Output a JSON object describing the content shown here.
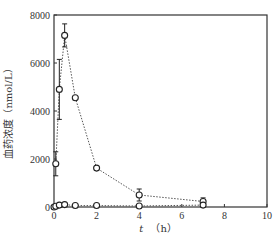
{
  "chart_data": {
    "type": "line",
    "title": "",
    "xlabel": "t （h）",
    "xlabel_var": "t",
    "xlabel_unit": "（h）",
    "ylabel": "血药浓度（nmol/L）",
    "xlim": [
      0,
      10
    ],
    "ylim": [
      0,
      8000
    ],
    "xticks": [
      0,
      2,
      4,
      6,
      8,
      10
    ],
    "yticks": [
      0,
      2000,
      4000,
      6000,
      8000
    ],
    "grid": false,
    "legend": "none",
    "series": [
      {
        "name": "series-1",
        "marker": "open-circle",
        "line_style": "dotted",
        "x": [
          0.083,
          0.25,
          0.5,
          1,
          2,
          4,
          7
        ],
        "y": [
          1800,
          4900,
          7150,
          4550,
          1620,
          500,
          230
        ],
        "err": [
          500,
          1250,
          480,
          0,
          80,
          250,
          150
        ]
      },
      {
        "name": "series-2",
        "marker": "open-circle",
        "line_style": "dotted",
        "x": [
          0,
          0.083,
          0.25,
          0.5,
          1,
          2,
          4,
          7
        ],
        "y": [
          0,
          30,
          80,
          100,
          60,
          60,
          40,
          80
        ],
        "err": [
          0,
          0,
          20,
          20,
          20,
          20,
          20,
          20
        ]
      }
    ]
  }
}
